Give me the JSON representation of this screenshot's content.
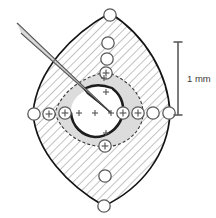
{
  "figure": {
    "name": "lens-cross-section-diagram",
    "background_color": "#ffffff",
    "outline_color": "#1a1a1a",
    "hatch_color": "#7d7d7d",
    "inner_fill_color": "#d9d9d9",
    "core_fill_color": "#ffffff",
    "marker_stroke_color": "#5a5a5a",
    "needle_color": "#4a4a4a"
  },
  "scale_bar": {
    "label": "1 mm",
    "color": "#5b5b5b",
    "x": 178,
    "y_top": 42,
    "y_bottom": 115,
    "cap_half_width": 4.5,
    "label_x": 187,
    "label_y": 82
  },
  "needle": {
    "name": "micropipette",
    "tip_x": 111,
    "tip_y": 113,
    "tail_top_x": 17,
    "tail_top_y": 23,
    "tail_bottom_x": 21,
    "tail_bottom_y": 35
  },
  "outer_shape": {
    "name": "vesica-outline",
    "center_x": 107,
    "center_y": 112,
    "top_x": 110,
    "top_y": 13,
    "bottom_x": 104,
    "bottom_y": 206,
    "left_x": 33,
    "left_y": 113,
    "right_x": 170,
    "right_y": 113
  },
  "inner_shape": {
    "name": "inner-shaded-region",
    "dash_pattern": "3 2"
  },
  "crescent": {
    "name": "dark-crescent-arc",
    "center_x": 96,
    "center_y": 112,
    "radius": 25,
    "start_angle_deg": 300,
    "end_angle_deg": 130
  },
  "markers": {
    "circle_radius": 6.2,
    "plus_half": 3.4,
    "small_plus_half": 3.0,
    "ring_circles": [
      {
        "name": "marker-top-1",
        "x": 110,
        "y": 15,
        "plus": false
      },
      {
        "name": "marker-top-2",
        "x": 108,
        "y": 43,
        "plus": false
      },
      {
        "name": "marker-top-3",
        "x": 107,
        "y": 59,
        "plus": false
      },
      {
        "name": "marker-top-4",
        "x": 106,
        "y": 73,
        "plus": true
      },
      {
        "name": "marker-bottom-1",
        "x": 105,
        "y": 146,
        "plus": true
      },
      {
        "name": "marker-bottom-2",
        "x": 105,
        "y": 176,
        "plus": false
      },
      {
        "name": "marker-bottom-3",
        "x": 104,
        "y": 206,
        "plus": false
      },
      {
        "name": "marker-left-outer",
        "x": 34,
        "y": 114,
        "plus": false
      },
      {
        "name": "marker-left-mid",
        "x": 49,
        "y": 114,
        "plus": true
      },
      {
        "name": "marker-left-inner",
        "x": 65,
        "y": 113,
        "plus": true
      },
      {
        "name": "marker-right-inner",
        "x": 123,
        "y": 113,
        "plus": true
      },
      {
        "name": "marker-right-mid",
        "x": 138,
        "y": 113,
        "plus": true
      },
      {
        "name": "marker-right-outer1",
        "x": 153,
        "y": 113,
        "plus": false
      },
      {
        "name": "marker-right-outer2",
        "x": 169,
        "y": 113,
        "plus": false
      }
    ],
    "plus_marks": [
      {
        "name": "plus-core-left",
        "x": 79,
        "y": 113
      },
      {
        "name": "plus-core-center",
        "x": 95,
        "y": 113
      },
      {
        "name": "plus-core-right",
        "x": 111,
        "y": 113
      },
      {
        "name": "plus-core-upper",
        "x": 106,
        "y": 92
      },
      {
        "name": "plus-core-up2",
        "x": 104,
        "y": 78
      },
      {
        "name": "plus-core-lower",
        "x": 106,
        "y": 133
      }
    ]
  }
}
